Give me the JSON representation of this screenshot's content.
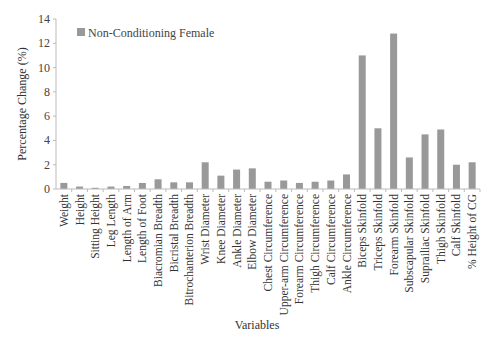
{
  "chart_data": {
    "type": "bar",
    "title": "",
    "xlabel": "Variables",
    "ylabel": "Percentage Change (%)",
    "ylim": [
      0,
      14
    ],
    "yticks": [
      0,
      2,
      4,
      6,
      8,
      10,
      12,
      14
    ],
    "grid": false,
    "legend_position": "upper-left inside",
    "categories": [
      "Weight",
      "Height",
      "Sitting Height",
      "Leg Length",
      "Length of Arm",
      "Length of Foot",
      "Biacromian Breadth",
      "Bicristal Breadth",
      "Bitrochanterion Breadth",
      "Wrist Diameter",
      "Knee Diameter",
      "Ankle Diameter",
      "Elbow Diameter",
      "Chest Circumference",
      "Upper-arm Circumference",
      "Forearm Circumference",
      "Thigh Circumference",
      "Calf Circumference",
      "Ankle Circumference",
      "Biceps Skinfold",
      "Triceps Skinfold",
      "Forearm Skinfold",
      "Subscapular Skinfold",
      "Suprailiac Skinfold",
      "Thigh Skinfold",
      "Calf Skinfold",
      "% Height of CG"
    ],
    "series": [
      {
        "name": "Non-Conditioning Female",
        "color": "#999999",
        "values": [
          0.5,
          0.2,
          0.1,
          0.2,
          0.25,
          0.5,
          0.8,
          0.55,
          0.55,
          2.2,
          1.1,
          1.6,
          1.7,
          0.6,
          0.7,
          0.5,
          0.6,
          0.7,
          1.2,
          11.0,
          5.0,
          12.8,
          2.6,
          4.5,
          4.9,
          2.0,
          2.2
        ]
      }
    ]
  }
}
